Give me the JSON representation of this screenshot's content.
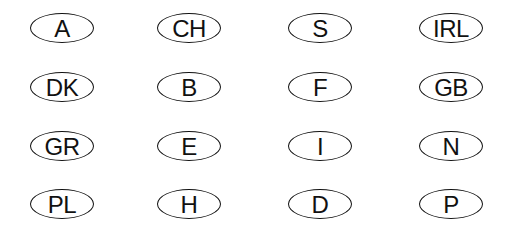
{
  "badges": [
    {
      "code": "A",
      "left": 30,
      "top": 13
    },
    {
      "code": "CH",
      "left": 157,
      "top": 13
    },
    {
      "code": "S",
      "left": 288,
      "top": 13
    },
    {
      "code": "IRL",
      "left": 419,
      "top": 13
    },
    {
      "code": "DK",
      "left": 30,
      "top": 72
    },
    {
      "code": "B",
      "left": 157,
      "top": 72
    },
    {
      "code": "F",
      "left": 288,
      "top": 72
    },
    {
      "code": "GB",
      "left": 419,
      "top": 72
    },
    {
      "code": "GR",
      "left": 30,
      "top": 131
    },
    {
      "code": "E",
      "left": 157,
      "top": 131
    },
    {
      "code": "I",
      "left": 288,
      "top": 131
    },
    {
      "code": "N",
      "left": 419,
      "top": 131
    },
    {
      "code": "PL",
      "left": 30,
      "top": 189
    },
    {
      "code": "H",
      "left": 157,
      "top": 189
    },
    {
      "code": "D",
      "left": 288,
      "top": 189
    },
    {
      "code": "P",
      "left": 419,
      "top": 189
    }
  ]
}
